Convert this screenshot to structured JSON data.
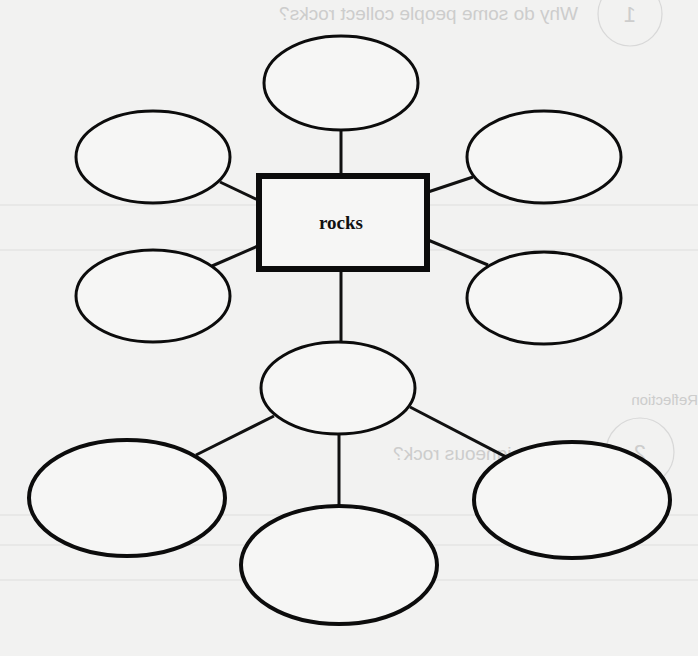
{
  "diagram": {
    "type": "concept-web",
    "center": {
      "label": "rocks"
    },
    "bubbles": [
      {
        "id": "top",
        "text": ""
      },
      {
        "id": "upper-left",
        "text": ""
      },
      {
        "id": "upper-right",
        "text": ""
      },
      {
        "id": "lower-left",
        "text": ""
      },
      {
        "id": "lower-right",
        "text": ""
      },
      {
        "id": "middle",
        "text": ""
      },
      {
        "id": "bottom-left",
        "text": ""
      },
      {
        "id": "bottom-center",
        "text": ""
      },
      {
        "id": "bottom-right",
        "text": ""
      }
    ],
    "colors": {
      "stroke": "#0c0c0c",
      "paper": "#f2f2f1",
      "showthrough": "#c9c9c9"
    }
  },
  "showthrough": {
    "question_1": "Why do some people collect rocks?",
    "number_1": "1",
    "section_label": "Reflection",
    "question_2": "What is igneous rock?",
    "number_2": "2"
  }
}
